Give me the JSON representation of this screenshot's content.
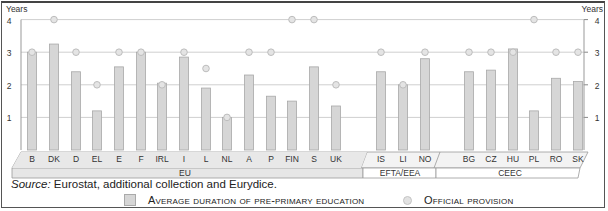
{
  "chart_data": {
    "type": "bar",
    "title": "",
    "ylabel_left": "Years",
    "ylabel_right": "Years",
    "ylim": [
      0,
      4
    ],
    "yticks": [
      1,
      2,
      3,
      4
    ],
    "grid": true,
    "groups": [
      {
        "name": "EU",
        "categories": [
          "B",
          "DK",
          "D",
          "EL",
          "E",
          "F",
          "IRL",
          "I",
          "L",
          "NL",
          "A",
          "P",
          "FIN",
          "S",
          "UK"
        ]
      },
      {
        "name": "EFTA/EEA",
        "categories": [
          "IS",
          "LI",
          "NO"
        ]
      },
      {
        "name": "CEEC",
        "categories": [
          "BG",
          "CZ",
          "HU",
          "PL",
          "RO",
          "SK"
        ]
      }
    ],
    "categories": [
      "B",
      "DK",
      "D",
      "EL",
      "E",
      "F",
      "IRL",
      "I",
      "L",
      "NL",
      "A",
      "P",
      "FIN",
      "S",
      "UK",
      "IS",
      "LI",
      "NO",
      "BG",
      "CZ",
      "HU",
      "PL",
      "RO",
      "SK"
    ],
    "series": [
      {
        "name": "Average duration of pre-primary education",
        "type": "bar",
        "values": [
          3.0,
          3.25,
          2.4,
          1.2,
          2.55,
          3.0,
          2.05,
          2.85,
          1.9,
          1.0,
          2.3,
          1.65,
          1.5,
          2.55,
          1.35,
          2.4,
          2.0,
          2.8,
          2.4,
          2.45,
          3.1,
          1.2,
          2.2,
          2.1
        ]
      },
      {
        "name": "Official provision",
        "type": "scatter",
        "values": [
          3,
          4,
          3,
          2,
          3,
          3,
          2,
          3,
          2.5,
          1,
          3,
          3,
          4,
          4,
          2,
          3,
          2,
          3,
          3,
          3,
          3,
          4,
          3,
          3
        ]
      }
    ],
    "legend": [
      "Average duration of pre-primary education",
      "Official provision"
    ],
    "legend_position": "bottom"
  },
  "source": {
    "label": "Source:",
    "text": " Eurostat, additional collection and Eurydice."
  },
  "legend_labels": {
    "bar": "Average duration of pre-primary education",
    "circle": "Official provision"
  },
  "colors": {
    "bar_fill": "#d6d6d6",
    "bar_stroke": "#a8a8a8",
    "circle_fill": "#e4e4e4",
    "circle_stroke": "#bdbdbd",
    "grid": "#cfcfcf",
    "band": "#e6e6e6"
  }
}
